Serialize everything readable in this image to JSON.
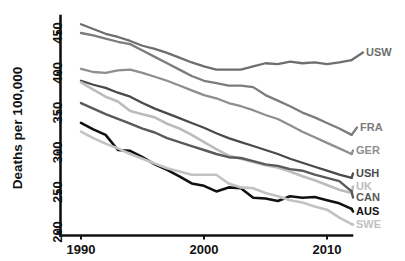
{
  "chart_data": {
    "type": "line",
    "title": "",
    "xlabel": "",
    "ylabel": "Deaths per 100,000",
    "xlim": [
      1989,
      2013
    ],
    "ylim": [
      195,
      465
    ],
    "xticks": [
      1990,
      2000,
      2010
    ],
    "xtick_labels": [
      "1990",
      "2000",
      "2010"
    ],
    "yticks": [
      200,
      250,
      300,
      350,
      400,
      450
    ],
    "ytick_labels": [
      "200",
      "250",
      "300",
      "350",
      "400",
      "450"
    ],
    "grid": false,
    "legend_position": "right-inline-end-of-line",
    "x": [
      1990,
      1991,
      1992,
      1993,
      1994,
      1995,
      1996,
      1997,
      1998,
      1999,
      2000,
      2001,
      2002,
      2003,
      2004,
      2005,
      2006,
      2007,
      2008,
      2009,
      2010,
      2011,
      2012
    ],
    "series": [
      {
        "name": "USW",
        "label": "USW",
        "color": "#6e6e6e",
        "width": 2.3,
        "values": [
          461,
          455,
          449,
          445,
          440,
          434,
          430,
          425,
          419,
          413,
          408,
          404,
          404,
          404,
          408,
          412,
          411,
          414,
          412,
          413,
          411,
          413,
          416
        ]
      },
      {
        "name": "FRA",
        "label": "FRA",
        "color": "#7c7c7c",
        "width": 2.3,
        "values": [
          450,
          447,
          443,
          439,
          436,
          428,
          420,
          412,
          404,
          396,
          390,
          387,
          384,
          384,
          382,
          372,
          365,
          358,
          350,
          344,
          337,
          330,
          322
        ]
      },
      {
        "name": "GER",
        "label": "GER",
        "color": "#8e8e8e",
        "width": 2.3,
        "values": [
          405,
          401,
          400,
          403,
          404,
          400,
          395,
          390,
          384,
          378,
          372,
          368,
          362,
          358,
          353,
          347,
          342,
          334,
          326,
          319,
          312,
          305,
          298
        ]
      },
      {
        "name": "USH",
        "label": "USH",
        "color": "#4a4a4a",
        "width": 2.3,
        "values": [
          390,
          385,
          381,
          375,
          370,
          362,
          355,
          349,
          343,
          337,
          331,
          324,
          318,
          313,
          308,
          303,
          298,
          292,
          287,
          282,
          277,
          272,
          268
        ]
      },
      {
        "name": "UK",
        "label": "UK",
        "color": "#bcbcbc",
        "width": 2.6,
        "values": [
          388,
          379,
          370,
          364,
          352,
          348,
          344,
          336,
          330,
          322,
          313,
          304,
          296,
          292,
          288,
          284,
          281,
          276,
          270,
          265,
          259,
          253,
          249
        ]
      },
      {
        "name": "CAN",
        "label": "CAN",
        "color": "#5a5a5a",
        "width": 2.4,
        "values": [
          362,
          355,
          348,
          342,
          336,
          330,
          325,
          318,
          313,
          308,
          303,
          298,
          294,
          293,
          289,
          285,
          283,
          279,
          277,
          272,
          268,
          264,
          251
        ]
      },
      {
        "name": "AUS",
        "label": "AUS",
        "color": "#111111",
        "width": 2.6,
        "values": [
          337,
          329,
          322,
          303,
          302,
          294,
          285,
          278,
          270,
          261,
          258,
          251,
          256,
          255,
          243,
          242,
          239,
          245,
          243,
          244,
          240,
          236,
          229
        ]
      },
      {
        "name": "SWE",
        "label": "SWE",
        "color": "#c2c2c2",
        "width": 2.6,
        "values": [
          326,
          318,
          311,
          305,
          298,
          292,
          286,
          280,
          276,
          272,
          272,
          272,
          261,
          256,
          255,
          249,
          245,
          240,
          237,
          232,
          228,
          218,
          210
        ]
      }
    ],
    "annotations": []
  },
  "yaxis": {
    "title": "Deaths per 100,000"
  }
}
